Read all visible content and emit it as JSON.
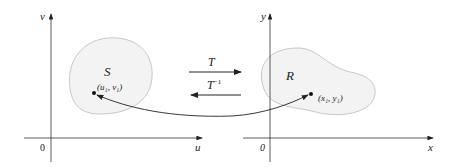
{
  "left_plane": {
    "axis_x_label": "u",
    "axis_y_label": "v",
    "origin_label": "0",
    "region_label": "S",
    "point_label": "(u₁, v₁)"
  },
  "right_plane": {
    "axis_x_label": "x",
    "axis_y_label": "y",
    "origin_label": "0",
    "region_label": "R",
    "point_label": "(x₁, y₁)"
  },
  "transform": {
    "forward_label": "T",
    "inverse_label": "T",
    "inverse_superscript": "−1"
  },
  "colors": {
    "region_fill": "#f3f3f3",
    "region_stroke": "#c8c8c8",
    "axis": "#333333",
    "arrow": "#222222"
  }
}
